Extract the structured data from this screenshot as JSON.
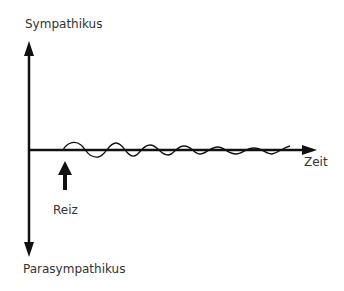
{
  "diagram": {
    "labels": {
      "top": "Sympathikus",
      "bottom": "Parasympathikus",
      "x_axis": "Zeit",
      "stimulus": "Reiz"
    },
    "colors": {
      "line": "#111111",
      "text": "#333333",
      "background": "#ffffff"
    }
  }
}
